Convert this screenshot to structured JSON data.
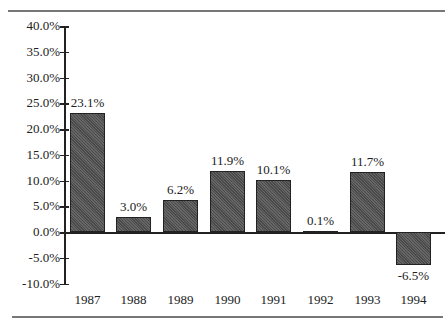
{
  "chart_data": {
    "type": "bar",
    "title": "",
    "xlabel": "",
    "ylabel": "",
    "categories": [
      "1987",
      "1988",
      "1989",
      "1990",
      "1991",
      "1992",
      "1993",
      "1994"
    ],
    "values": [
      23.1,
      3.0,
      6.2,
      11.9,
      10.1,
      0.1,
      11.7,
      -6.5
    ],
    "value_labels": [
      "23.1%",
      "3.0%",
      "6.2%",
      "11.9%",
      "10.1%",
      "0.1%",
      "11.7%",
      "-6.5%"
    ],
    "ylim": [
      -10,
      40
    ],
    "yticks": [
      40,
      35,
      30,
      25,
      20,
      15,
      10,
      5,
      0,
      -5,
      -10
    ],
    "ytick_labels": [
      "40.0%",
      "35.0%",
      "30.0%",
      "25.0%",
      "20.0%",
      "15.0%",
      "10.0%",
      "5.0%",
      "0.0%",
      "-5.0%",
      "-10.0%"
    ],
    "grid": false,
    "legend": null,
    "bar_color": "#555555"
  }
}
